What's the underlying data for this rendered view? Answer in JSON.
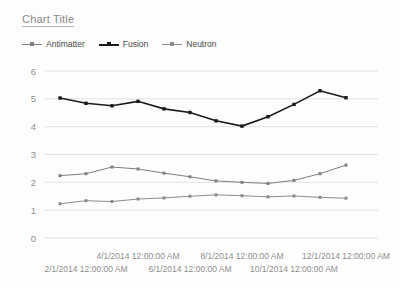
{
  "title": "Chart Title",
  "legend": {
    "position": "top-left",
    "entries": [
      {
        "label": "Antimatter",
        "color": "#7f7f7f",
        "marker": "square"
      },
      {
        "label": "Fusion",
        "color": "#1a1a1a",
        "marker": "square"
      },
      {
        "label": "Neutron",
        "color": "#8c8c8c",
        "marker": "square"
      }
    ]
  },
  "axes": {
    "y_ticks": [
      "0",
      "1",
      "2",
      "3",
      "4",
      "5",
      "6"
    ],
    "x_ticks": [
      "2/1/2014 12:00:00 AM",
      "4/1/2014 12:00:00 AM",
      "6/1/2014 12:00:00 AM",
      "8/1/2014 12:00:00 AM",
      "10/1/2014 12:00:00 AM",
      "12/1/2014 12:00:00 AM"
    ]
  },
  "chart_data": {
    "type": "line",
    "title": "Chart Title",
    "xlabel": "",
    "ylabel": "",
    "ylim": [
      0,
      6
    ],
    "grid": true,
    "legend_position": "top-left",
    "categories": [
      "1/1/2014 12:00:00 AM",
      "2/1/2014 12:00:00 AM",
      "3/1/2014 12:00:00 AM",
      "4/1/2014 12:00:00 AM",
      "5/1/2014 12:00:00 AM",
      "6/1/2014 12:00:00 AM",
      "7/1/2014 12:00:00 AM",
      "8/1/2014 12:00:00 AM",
      "9/1/2014 12:00:00 AM",
      "10/1/2014 12:00:00 AM",
      "11/1/2014 12:00:00 AM",
      "12/1/2014 12:00:00 AM"
    ],
    "x_tick_labels_shown": [
      "2/1/2014 12:00:00 AM",
      "4/1/2014 12:00:00 AM",
      "6/1/2014 12:00:00 AM",
      "8/1/2014 12:00:00 AM",
      "10/1/2014 12:00:00 AM",
      "12/1/2014 12:00:00 AM"
    ],
    "y_tick_labels": [
      0,
      1,
      2,
      3,
      4,
      5,
      6
    ],
    "series": [
      {
        "name": "Antimatter",
        "color": "#7f7f7f",
        "line_width": 1,
        "values": [
          2.24,
          2.31,
          2.55,
          2.48,
          2.33,
          2.2,
          2.05,
          2.0,
          1.96,
          2.07,
          2.31,
          2.62
        ]
      },
      {
        "name": "Fusion",
        "color": "#1a1a1a",
        "line_width": 1.6,
        "values": [
          5.03,
          4.84,
          4.75,
          4.91,
          4.64,
          4.51,
          4.21,
          4.02,
          4.36,
          4.8,
          5.29,
          5.04
        ]
      },
      {
        "name": "Neutron",
        "color": "#8c8c8c",
        "line_width": 1,
        "values": [
          1.23,
          1.34,
          1.31,
          1.4,
          1.44,
          1.5,
          1.55,
          1.52,
          1.48,
          1.51,
          1.46,
          1.43
        ]
      }
    ]
  }
}
